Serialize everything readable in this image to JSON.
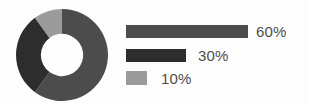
{
  "figure": {
    "background": "#fdfdfd"
  },
  "chart_data": {
    "type": "pie",
    "variant": "donut",
    "title": "",
    "subtitle": "",
    "xlabel": "",
    "ylabel": "",
    "grid": false,
    "legend_position": "right",
    "start_angle_deg": 0,
    "direction": "clockwise",
    "inner_radius_ratio": 0.46,
    "labels": [
      "60%",
      "30%",
      "10%"
    ],
    "values": [
      60,
      30,
      10
    ],
    "unit": "%",
    "colors": [
      "#4c4c4c",
      "#2d2d2d",
      "#9b9b9b"
    ],
    "slices": [
      {
        "label": "60%",
        "value": 60,
        "color": "#4c4c4c",
        "start_deg": 0,
        "end_deg": 216
      },
      {
        "label": "30%",
        "value": 30,
        "color": "#2d2d2d",
        "start_deg": 216,
        "end_deg": 324
      },
      {
        "label": "10%",
        "value": 10,
        "color": "#9b9b9b",
        "start_deg": 324,
        "end_deg": 360
      }
    ],
    "legend": [
      {
        "label": "60%",
        "value": 60,
        "color": "#4c4c4c",
        "bar_width_px": 122
      },
      {
        "label": "30%",
        "value": 30,
        "color": "#2d2d2d",
        "bar_width_px": 60
      },
      {
        "label": "10%",
        "value": 10,
        "color": "#9b9b9b",
        "bar_width_px": 21
      }
    ]
  }
}
